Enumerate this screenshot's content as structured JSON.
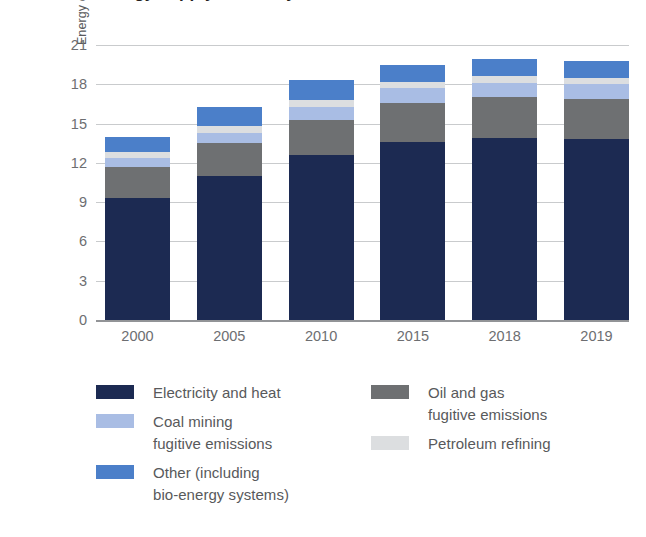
{
  "title": {
    "text": "Energy supply sector by source",
    "cropped": true
  },
  "chart_data": {
    "type": "bar",
    "stacked": true,
    "title": "Energy supply sector by source",
    "xlabel": "",
    "ylabel": "Energy emissions (GtCO2-eq)",
    "ylabel_html": "Energy emissions (GtCO<sub>2</sub>-eq)",
    "categories": [
      "2000",
      "2005",
      "2010",
      "2015",
      "2018",
      "2019"
    ],
    "ylim": [
      0,
      21
    ],
    "yticks": [
      0,
      3,
      6,
      9,
      12,
      15,
      18,
      21
    ],
    "grid": true,
    "legend_position": "below",
    "series": [
      {
        "name": "Electricity and heat",
        "color": "#1c2a52",
        "values": [
          9.3,
          11.0,
          12.6,
          13.6,
          13.9,
          13.8
        ]
      },
      {
        "name": "Oil and gas\nfugitive emissions",
        "color": "#6e7072",
        "values": [
          2.4,
          2.5,
          2.7,
          3.0,
          3.1,
          3.1
        ]
      },
      {
        "name": "Coal mining\nfugitive emissions",
        "color": "#a9bde4",
        "values": [
          0.7,
          0.8,
          1.0,
          1.1,
          1.1,
          1.1
        ]
      },
      {
        "name": "Petroleum refining",
        "color": "#dcdee0",
        "values": [
          0.4,
          0.5,
          0.5,
          0.5,
          0.5,
          0.5
        ]
      },
      {
        "name": "Other (including\nbio-energy systems)",
        "color": "#4b7fc9",
        "values": [
          1.2,
          1.5,
          1.5,
          1.3,
          1.3,
          1.3
        ]
      }
    ],
    "totals": [
      14.0,
      16.3,
      18.3,
      19.5,
      19.9,
      19.8
    ]
  },
  "legend": {
    "left": [
      {
        "label": "Electricity and heat",
        "color": "#1c2a52"
      },
      {
        "label": "Coal mining\nfugitive emissions",
        "color": "#a9bde4"
      },
      {
        "label": "Other (including\nbio-energy systems)",
        "color": "#4b7fc9"
      }
    ],
    "right": [
      {
        "label": "Oil and gas\nfugitive emissions",
        "color": "#6e7072"
      },
      {
        "label": "Petroleum refining",
        "color": "#dcdee0"
      }
    ]
  },
  "colors": {
    "grid": "#c9cbcd",
    "axis": "#929497",
    "tick_text": "#6d6e71",
    "label_text": "#58595b",
    "background": "#ffffff"
  }
}
